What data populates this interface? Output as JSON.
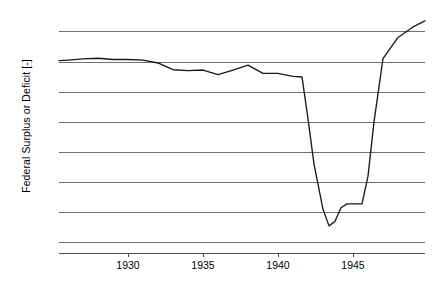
{
  "chart_data": {
    "type": "line",
    "title": "",
    "xlabel": "",
    "ylabel": "Federal Surplus or Deficit [-]",
    "xlim": [
      1925.4,
      1949.8
    ],
    "ylim": [
      -63500,
      13800
    ],
    "grid": true,
    "legend": null,
    "yticks": [
      10000,
      0,
      -10000,
      -20000,
      -30000,
      -40000,
      -50000,
      -60000
    ],
    "ytick_labels": [
      "10k",
      "0k",
      "-10k",
      "-20k",
      "-30k",
      "-40k",
      "-50k",
      "-60k"
    ],
    "xticks": [
      1930,
      1935,
      1940,
      1945
    ],
    "xtick_labels": [
      "1930",
      "1935",
      "1940",
      "1945"
    ],
    "series": [
      {
        "name": "Federal Surplus or Deficit [-]",
        "color": "#1a1a1a",
        "x": [
          1925.4,
          1926.0,
          1927.0,
          1928.0,
          1929.0,
          1930.0,
          1931.0,
          1932.0,
          1933.0,
          1934.0,
          1935.0,
          1936.0,
          1937.0,
          1938.0,
          1939.0,
          1940.0,
          1941.0,
          1941.6,
          1942.0,
          1942.4,
          1943.0,
          1943.4,
          1943.8,
          1944.2,
          1944.6,
          1945.0,
          1945.6,
          1946.0,
          1946.4,
          1947.0,
          1948.0,
          1949.0,
          1949.8
        ],
        "y": [
          300,
          500,
          900,
          1100,
          700,
          700,
          500,
          -460,
          -2700,
          -3000,
          -2800,
          -4300,
          -2800,
          -1200,
          -3900,
          -3900,
          -4900,
          -5100,
          -19000,
          -34000,
          -49000,
          -54500,
          -53000,
          -48500,
          -47200,
          -47200,
          -47200,
          -38000,
          -20000,
          1000,
          8000,
          11500,
          13500
        ]
      }
    ]
  }
}
